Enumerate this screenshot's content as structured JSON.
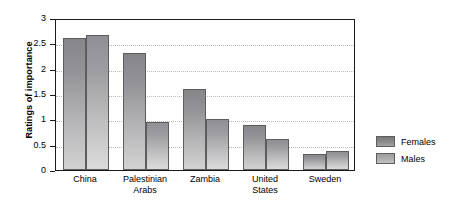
{
  "chart_data": {
    "type": "bar",
    "title": "",
    "xlabel": "",
    "ylabel": "Ratings of importance",
    "ylim": [
      0,
      3
    ],
    "yticks": [
      "0",
      "0.5",
      "1",
      "1.5",
      "2",
      "2.5",
      "3"
    ],
    "ytick_values": [
      0,
      0.5,
      1,
      1.5,
      2,
      2.5,
      3
    ],
    "grid": true,
    "legend_position": "right",
    "categories": [
      "China",
      "Palestinian\nArabs",
      "Zambia",
      "United\nStates",
      "Sweden"
    ],
    "series": [
      {
        "name": "Females",
        "color": "#8c8c90",
        "values": [
          2.6,
          2.3,
          1.6,
          0.88,
          0.32
        ]
      },
      {
        "name": "Males",
        "color": "#aeaeb1",
        "values": [
          2.67,
          0.95,
          1.0,
          0.62,
          0.37
        ]
      }
    ]
  },
  "legend": {
    "items": [
      {
        "label": "Females"
      },
      {
        "label": "Males"
      }
    ]
  }
}
